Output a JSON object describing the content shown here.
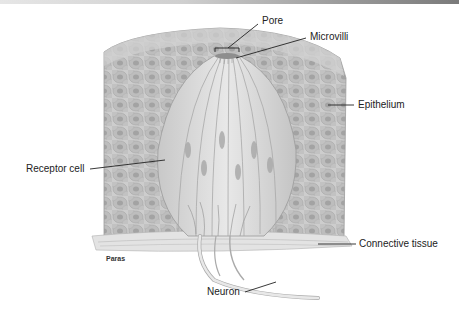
{
  "figure": {
    "labels": {
      "pore": "Pore",
      "microvilli": "Microvilli",
      "epithelium": "Epithelium",
      "receptor_cell": "Receptor cell",
      "connective_tissue": "Connective tissue",
      "neuron": "Neuron"
    },
    "credit": "Paras"
  },
  "colors": {
    "tissue_fill": "#c9c9c9",
    "cell_fill": "#b5b5b5",
    "bud_fill": "#dcdcdc",
    "line": "#222222"
  }
}
